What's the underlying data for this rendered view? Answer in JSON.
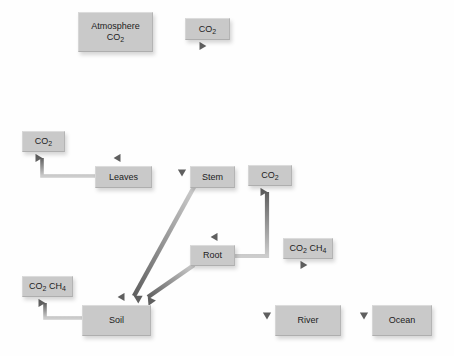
{
  "diagram": {
    "background_color": "#fefefe",
    "node_color": "#c9c9c9",
    "arrow_color_dark": "#6e6e6e",
    "arrow_color_light": "#c2c2c2",
    "nodes": [
      {
        "id": "atmosphere",
        "label_line1": "Atmosphere",
        "label_line2": "CO2",
        "x": 78,
        "y": 12,
        "w": 73,
        "h": 38
      },
      {
        "id": "co2_top",
        "label_line1": "CO2",
        "label_line2": "",
        "x": 185,
        "y": 18,
        "w": 43,
        "h": 20
      },
      {
        "id": "co2_left",
        "label_line1": "CO2",
        "label_line2": "",
        "x": 22,
        "y": 131,
        "w": 41,
        "h": 19
      },
      {
        "id": "leaves",
        "label_line1": "Leaves",
        "label_line2": "",
        "x": 95,
        "y": 166,
        "w": 55,
        "h": 20
      },
      {
        "id": "stem",
        "label_line1": "Stem",
        "label_line2": "",
        "x": 190,
        "y": 166,
        "w": 43,
        "h": 20
      },
      {
        "id": "co2_right",
        "label_line1": "CO2",
        "label_line2": "",
        "x": 248,
        "y": 165,
        "w": 42,
        "h": 19
      },
      {
        "id": "root",
        "label_line1": "Root",
        "label_line2": "",
        "x": 190,
        "y": 245,
        "w": 43,
        "h": 19
      },
      {
        "id": "co2ch4_right",
        "label_line1": "CO2 CH4",
        "label_line2": "",
        "x": 283,
        "y": 238,
        "w": 48,
        "h": 19
      },
      {
        "id": "co2ch4_left",
        "label_line1": "CO2 CH4",
        "label_line2": "",
        "x": 22,
        "y": 276,
        "w": 49,
        "h": 19
      },
      {
        "id": "soil",
        "label_line1": "Soil",
        "label_line2": "",
        "x": 82,
        "y": 305,
        "w": 67,
        "h": 29
      },
      {
        "id": "river",
        "label_line1": "River",
        "label_line2": "",
        "x": 275,
        "y": 305,
        "w": 64,
        "h": 29
      },
      {
        "id": "ocean",
        "label_line1": "Ocean",
        "label_line2": "",
        "x": 372,
        "y": 305,
        "w": 58,
        "h": 29
      }
    ],
    "flows": [
      {
        "from": "atmosphere",
        "to": "leaves",
        "kind": "straight-down"
      },
      {
        "from": "stem",
        "to": "co2_top",
        "kind": "straight-up"
      },
      {
        "from": "leaves",
        "to": "stem",
        "kind": "straight-right"
      },
      {
        "from": "leaves",
        "to": "co2_left",
        "kind": "elbow-left-up"
      },
      {
        "from": "leaves",
        "to": "soil",
        "kind": "straight-down"
      },
      {
        "from": "stem",
        "to": "root",
        "kind": "straight-down"
      },
      {
        "from": "stem",
        "to": "soil",
        "kind": "diagonal-down-left"
      },
      {
        "from": "root",
        "to": "soil",
        "kind": "diagonal-down-left"
      },
      {
        "from": "root",
        "to": "co2_right",
        "kind": "elbow-right-up"
      },
      {
        "from": "soil",
        "to": "co2ch4_left",
        "kind": "elbow-left-up"
      },
      {
        "from": "soil",
        "to": "river",
        "kind": "straight-right"
      },
      {
        "from": "river",
        "to": "co2ch4_right",
        "kind": "straight-up"
      },
      {
        "from": "river",
        "to": "ocean",
        "kind": "straight-right"
      }
    ]
  }
}
